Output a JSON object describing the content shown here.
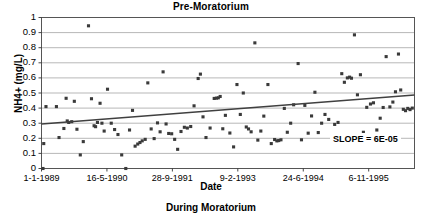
{
  "chart_data": {
    "type": "scatter",
    "title": "Pre-Moratorium",
    "caption_below": "During Moratorium",
    "xlabel": "Date",
    "ylabel": "NH4+ (mg/L)",
    "ylim": [
      0,
      1
    ],
    "ytick_labels": [
      "0",
      "0.1",
      "0.2",
      "0.3",
      "0.4",
      "0.5",
      "0.6",
      "0.7",
      "0.8",
      "0.9",
      "1"
    ],
    "ytick_values": [
      0,
      0.1,
      0.2,
      0.3,
      0.4,
      0.5,
      0.6,
      0.7,
      0.8,
      0.9,
      1
    ],
    "xtick_labels": [
      "1-1-1989",
      "16-5-1990",
      "28-9-1991",
      "9-2-1993",
      "24-6-1994",
      "6-11-1995"
    ],
    "xtick_positions": [
      0,
      0.1754,
      0.3509,
      0.5263,
      0.7018,
      0.8772
    ],
    "xlim_note": "fractional position along axis, 0 = 1-1-1989",
    "grid": "horizontal",
    "legend": "none",
    "marker": "filled-square",
    "marker_color": "#3a3a3a",
    "trendline": {
      "label": "SLOPE = 6E-05",
      "y_start": 0.295,
      "y_end": 0.487,
      "color": "#404040"
    },
    "points": [
      {
        "x": 0.004,
        "y": 0.0
      },
      {
        "x": 0.006,
        "y": 0.165
      },
      {
        "x": 0.012,
        "y": 0.41
      },
      {
        "x": 0.04,
        "y": 0.41
      },
      {
        "x": 0.047,
        "y": 0.205
      },
      {
        "x": 0.06,
        "y": 0.265
      },
      {
        "x": 0.066,
        "y": 0.465
      },
      {
        "x": 0.069,
        "y": 0.315
      },
      {
        "x": 0.073,
        "y": 0.305
      },
      {
        "x": 0.081,
        "y": 0.31
      },
      {
        "x": 0.088,
        "y": 0.445
      },
      {
        "x": 0.095,
        "y": 0.26
      },
      {
        "x": 0.104,
        "y": 0.09
      },
      {
        "x": 0.112,
        "y": 0.178
      },
      {
        "x": 0.126,
        "y": 0.945
      },
      {
        "x": 0.134,
        "y": 0.462
      },
      {
        "x": 0.141,
        "y": 0.283
      },
      {
        "x": 0.145,
        "y": 0.277
      },
      {
        "x": 0.15,
        "y": 0.305
      },
      {
        "x": 0.157,
        "y": 0.432
      },
      {
        "x": 0.162,
        "y": 0.3
      },
      {
        "x": 0.168,
        "y": 0.248
      },
      {
        "x": 0.177,
        "y": 0.525
      },
      {
        "x": 0.187,
        "y": 0.3
      },
      {
        "x": 0.196,
        "y": 0.258
      },
      {
        "x": 0.205,
        "y": 0.225
      },
      {
        "x": 0.215,
        "y": 0.09
      },
      {
        "x": 0.226,
        "y": 0.0
      },
      {
        "x": 0.236,
        "y": 0.255
      },
      {
        "x": 0.244,
        "y": 0.385
      },
      {
        "x": 0.251,
        "y": 0.148
      },
      {
        "x": 0.258,
        "y": 0.162
      },
      {
        "x": 0.264,
        "y": 0.172
      },
      {
        "x": 0.27,
        "y": 0.183
      },
      {
        "x": 0.278,
        "y": 0.193
      },
      {
        "x": 0.285,
        "y": 0.567
      },
      {
        "x": 0.294,
        "y": 0.262
      },
      {
        "x": 0.302,
        "y": 0.198
      },
      {
        "x": 0.311,
        "y": 0.302
      },
      {
        "x": 0.318,
        "y": 0.243
      },
      {
        "x": 0.326,
        "y": 0.64
      },
      {
        "x": 0.334,
        "y": 0.295
      },
      {
        "x": 0.341,
        "y": 0.232
      },
      {
        "x": 0.349,
        "y": 0.23
      },
      {
        "x": 0.357,
        "y": 0.193
      },
      {
        "x": 0.365,
        "y": 0.127
      },
      {
        "x": 0.374,
        "y": 0.245
      },
      {
        "x": 0.383,
        "y": 0.273
      },
      {
        "x": 0.391,
        "y": 0.268
      },
      {
        "x": 0.4,
        "y": 0.278
      },
      {
        "x": 0.409,
        "y": 0.415
      },
      {
        "x": 0.42,
        "y": 0.596
      },
      {
        "x": 0.426,
        "y": 0.625
      },
      {
        "x": 0.433,
        "y": 0.342
      },
      {
        "x": 0.441,
        "y": 0.205
      },
      {
        "x": 0.452,
        "y": 0.268
      },
      {
        "x": 0.463,
        "y": 0.464
      },
      {
        "x": 0.469,
        "y": 0.466
      },
      {
        "x": 0.474,
        "y": 0.468
      },
      {
        "x": 0.479,
        "y": 0.477
      },
      {
        "x": 0.486,
        "y": 0.263
      },
      {
        "x": 0.493,
        "y": 0.352
      },
      {
        "x": 0.505,
        "y": 0.235
      },
      {
        "x": 0.515,
        "y": 0.143
      },
      {
        "x": 0.524,
        "y": 0.556
      },
      {
        "x": 0.533,
        "y": 0.358
      },
      {
        "x": 0.541,
        "y": 0.5
      },
      {
        "x": 0.549,
        "y": 0.275
      },
      {
        "x": 0.555,
        "y": 0.262
      },
      {
        "x": 0.562,
        "y": 0.243
      },
      {
        "x": 0.572,
        "y": 0.832
      },
      {
        "x": 0.58,
        "y": 0.188
      },
      {
        "x": 0.588,
        "y": 0.248
      },
      {
        "x": 0.596,
        "y": 0.347
      },
      {
        "x": 0.607,
        "y": 0.556
      },
      {
        "x": 0.616,
        "y": 0.165
      },
      {
        "x": 0.625,
        "y": 0.192
      },
      {
        "x": 0.631,
        "y": 0.183
      },
      {
        "x": 0.636,
        "y": 0.185
      },
      {
        "x": 0.642,
        "y": 0.19
      },
      {
        "x": 0.651,
        "y": 0.398
      },
      {
        "x": 0.659,
        "y": 0.24
      },
      {
        "x": 0.668,
        "y": 0.3
      },
      {
        "x": 0.676,
        "y": 0.422
      },
      {
        "x": 0.688,
        "y": 0.695
      },
      {
        "x": 0.697,
        "y": 0.19
      },
      {
        "x": 0.706,
        "y": 0.418
      },
      {
        "x": 0.715,
        "y": 0.234
      },
      {
        "x": 0.724,
        "y": 0.348
      },
      {
        "x": 0.733,
        "y": 0.505
      },
      {
        "x": 0.742,
        "y": 0.238
      },
      {
        "x": 0.751,
        "y": 0.3
      },
      {
        "x": 0.76,
        "y": 0.358
      },
      {
        "x": 0.77,
        "y": 0.325
      },
      {
        "x": 0.778,
        "y": 0.178
      },
      {
        "x": 0.786,
        "y": 0.292
      },
      {
        "x": 0.795,
        "y": 0.305
      },
      {
        "x": 0.805,
        "y": 0.628
      },
      {
        "x": 0.812,
        "y": 0.571
      },
      {
        "x": 0.82,
        "y": 0.6
      },
      {
        "x": 0.826,
        "y": 0.605
      },
      {
        "x": 0.831,
        "y": 0.598
      },
      {
        "x": 0.839,
        "y": 0.885
      },
      {
        "x": 0.847,
        "y": 0.488
      },
      {
        "x": 0.855,
        "y": 0.621
      },
      {
        "x": 0.863,
        "y": 0.24
      },
      {
        "x": 0.872,
        "y": 0.405
      },
      {
        "x": 0.882,
        "y": 0.427
      },
      {
        "x": 0.89,
        "y": 0.435
      },
      {
        "x": 0.899,
        "y": 0.255
      },
      {
        "x": 0.908,
        "y": 0.333
      },
      {
        "x": 0.916,
        "y": 0.404
      },
      {
        "x": 0.924,
        "y": 0.741
      },
      {
        "x": 0.934,
        "y": 0.408
      },
      {
        "x": 0.942,
        "y": 0.44
      },
      {
        "x": 0.949,
        "y": 0.508
      },
      {
        "x": 0.957,
        "y": 0.758
      },
      {
        "x": 0.963,
        "y": 0.52
      },
      {
        "x": 0.97,
        "y": 0.392
      },
      {
        "x": 0.976,
        "y": 0.383
      },
      {
        "x": 0.982,
        "y": 0.398
      },
      {
        "x": 0.988,
        "y": 0.39
      },
      {
        "x": 0.994,
        "y": 0.4
      }
    ]
  }
}
